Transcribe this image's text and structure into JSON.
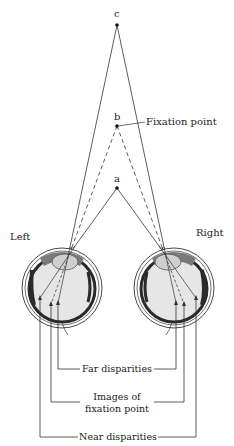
{
  "diagram": {
    "points": [
      {
        "id": "c",
        "label": "c",
        "x": 117,
        "y": 25
      },
      {
        "id": "b",
        "label": "b",
        "x": 117,
        "y": 126
      },
      {
        "id": "a",
        "label": "a",
        "x": 117,
        "y": 188
      }
    ],
    "fixation_label": "Fixation point",
    "eyes": {
      "left_label": "Left",
      "right_label": "Right"
    },
    "brackets": {
      "far": "Far disparities",
      "fixation_line1": "Images of",
      "fixation_line2": "fixation point",
      "near": "Near disparities"
    },
    "colors": {
      "line": "#333333",
      "eye_fill": "#e6e6e6",
      "eye_dark": "#2a2a2a",
      "lens": "#cfcfcf"
    }
  }
}
